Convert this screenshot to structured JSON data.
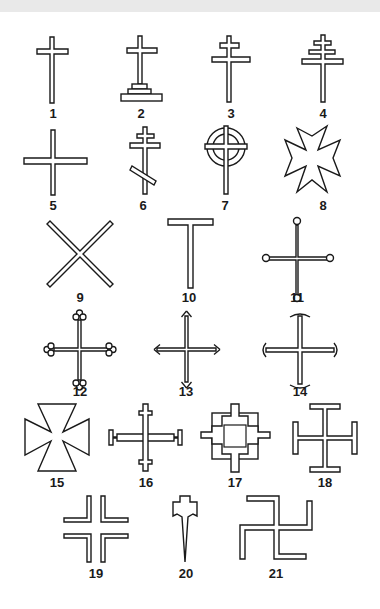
{
  "figure": {
    "background": "#ffffff",
    "ink": "#1a1a1a",
    "items": [
      {
        "number": "1",
        "shape": "latin-cross"
      },
      {
        "number": "2",
        "shape": "calvary-cross"
      },
      {
        "number": "3",
        "shape": "patriarchal-cross"
      },
      {
        "number": "4",
        "shape": "papal-cross"
      },
      {
        "number": "5",
        "shape": "greek-cross"
      },
      {
        "number": "6",
        "shape": "russian-orthodox-cross"
      },
      {
        "number": "7",
        "shape": "celtic-cross"
      },
      {
        "number": "8",
        "shape": "maltese-cross"
      },
      {
        "number": "9",
        "shape": "saint-andrews-cross"
      },
      {
        "number": "10",
        "shape": "tau-cross"
      },
      {
        "number": "11",
        "shape": "pommee-cross"
      },
      {
        "number": "12",
        "shape": "botonnee-cross"
      },
      {
        "number": "13",
        "shape": "fleury-cross"
      },
      {
        "number": "14",
        "shape": "moline-cross"
      },
      {
        "number": "15",
        "shape": "formee-cross"
      },
      {
        "number": "16",
        "shape": "crosslet-cross"
      },
      {
        "number": "17",
        "shape": "stepped-cross"
      },
      {
        "number": "18",
        "shape": "potent-cross"
      },
      {
        "number": "19",
        "shape": "voided-cross"
      },
      {
        "number": "20",
        "shape": "fitchee-cross"
      },
      {
        "number": "21",
        "shape": "swastika"
      }
    ]
  }
}
